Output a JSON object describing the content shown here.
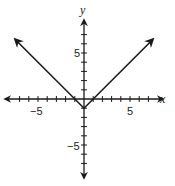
{
  "chart_data": {
    "type": "line",
    "title": "",
    "function": "y = |x| - 1",
    "xlabel": "x",
    "ylabel": "y",
    "xlim": [
      -8,
      8
    ],
    "ylim": [
      -8,
      8
    ],
    "grid": false,
    "x_tick_labels": [
      "-5",
      "5"
    ],
    "y_tick_labels": [
      "5",
      "-5"
    ],
    "tick_interval": 1,
    "series": [
      {
        "name": "y = |x| - 1",
        "x": [
          -7.5,
          0,
          7.5
        ],
        "y": [
          6.5,
          -1,
          6.5
        ],
        "arrows_at_ends": true
      }
    ],
    "vertex": [
      0,
      -1
    ],
    "x_intercepts": [
      -1,
      1
    ],
    "y_intercept": -1
  },
  "labels": {
    "x_axis": "x",
    "y_axis": "y",
    "x_neg5": "−5",
    "x_pos5": "5",
    "y_pos5": "5",
    "y_neg5": "−5"
  },
  "colors": {
    "stroke": "#1a1a1a",
    "background": "#ffffff"
  }
}
